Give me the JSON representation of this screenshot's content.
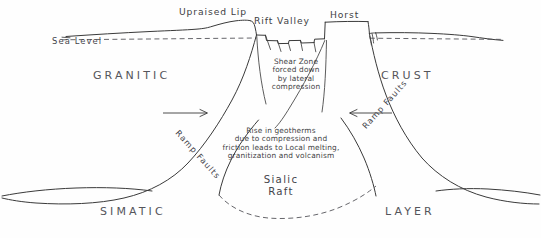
{
  "diagram": {
    "background_color": "#fefefe",
    "ink_color": "#3a3a3a",
    "labels": {
      "sea_level": "Sea Level",
      "upraised_lip": "Upraised Lip",
      "rift_valley": "Rift Valley",
      "horst": "Horst",
      "granitic": "GRANITIC",
      "crust": "CRUST",
      "simatic": "SIMATIC",
      "layer": "LAYER",
      "sialic_raft_line1": "Sialic",
      "sialic_raft_line2": "Raft",
      "ramp_faults_left": "Ramp Faults",
      "ramp_faults_right": "Ramp Faults"
    },
    "annotations": {
      "shear_zone": {
        "line1": "Shear Zone",
        "line2": "forced down",
        "line3": "by lateral",
        "line4": "compression"
      },
      "geotherms": {
        "line1": "Rise in geotherms",
        "line2": "due to compression and",
        "line3": "friction leads to Local melting,",
        "line4": "granitization and volcanism"
      }
    },
    "arrows": [
      {
        "name": "left-compression-arrow",
        "direction": "right"
      },
      {
        "name": "right-compression-arrow",
        "direction": "left"
      }
    ]
  }
}
